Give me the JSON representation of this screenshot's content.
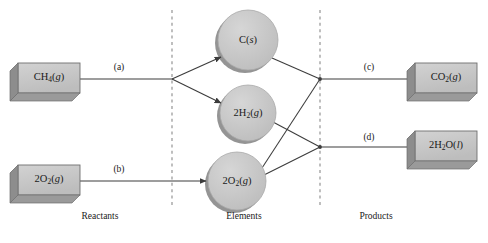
{
  "diagram": {
    "background_color": "#ffffff",
    "shape_fill_color": "#c8c8c8",
    "shape_shadow_color": "#8f8f8f",
    "shape_border_color": "#6b6b6b",
    "line_color": "#3c3c3c",
    "divider_color": "#8a8a8a",
    "text_color": "#1a1a1a"
  },
  "columns": [
    {
      "id": "reactants",
      "label": "Reactants",
      "x": 100,
      "y": 216
    },
    {
      "id": "elements",
      "label": "Elements",
      "x": 244,
      "y": 216
    },
    {
      "id": "products",
      "label": "Products",
      "x": 376,
      "y": 216
    }
  ],
  "dividers": [
    {
      "id": "divider-left",
      "x": 172,
      "y1": 10,
      "y2": 206
    },
    {
      "id": "divider-right",
      "x": 320,
      "y1": 10,
      "y2": 206
    }
  ],
  "boxes": [
    {
      "id": "box-ch4",
      "name": "reactant-methane",
      "formula_html": "CH<sub>4</sub>(<i>g</i>)",
      "formula_text": "CH4(g)",
      "x": 18,
      "y": 63,
      "w": 62,
      "h": 30
    },
    {
      "id": "box-o2",
      "name": "reactant-oxygen",
      "formula_html": "2O<sub>2</sub>(<i>g</i>)",
      "formula_text": "2O2(g)",
      "x": 18,
      "y": 165,
      "w": 62,
      "h": 30
    },
    {
      "id": "box-co2",
      "name": "product-carbon-dioxide",
      "formula_html": "CO<sub>2</sub>(<i>g</i>)",
      "formula_text": "CO2(g)",
      "x": 415,
      "y": 63,
      "w": 62,
      "h": 30
    },
    {
      "id": "box-h2o",
      "name": "product-water",
      "formula_html": "2H<sub>2</sub>O(<i>l</i>)",
      "formula_text": "2H2O(l)",
      "x": 415,
      "y": 131,
      "w": 62,
      "h": 30
    }
  ],
  "circles": [
    {
      "id": "circle-carbon",
      "name": "element-carbon",
      "formula_html": "C(<i>s</i>)",
      "formula_text": "C(s)",
      "cx": 248,
      "cy": 40,
      "r": 30
    },
    {
      "id": "circle-hydrogen",
      "name": "element-hydrogen",
      "formula_html": "2H<sub>2</sub>(<i>g</i>)",
      "formula_text": "2H2(g)",
      "cx": 248,
      "cy": 113,
      "r": 28
    },
    {
      "id": "circle-oxygen",
      "name": "element-oxygen",
      "formula_html": "2O<sub>2</sub>(<i>g</i>)",
      "formula_text": "2O2(g)",
      "cx": 237,
      "cy": 181,
      "r": 29
    }
  ],
  "edge_labels": [
    {
      "id": "label-a",
      "text": "(a)",
      "x": 119,
      "y": 62
    },
    {
      "id": "label-b",
      "text": "(b)",
      "x": 119,
      "y": 164
    },
    {
      "id": "label-c",
      "text": "(c)",
      "x": 369,
      "y": 62
    },
    {
      "id": "label-d",
      "text": "(d)",
      "x": 369,
      "y": 132
    }
  ],
  "arrows": [
    {
      "id": "arrow-a-stem",
      "from": "box-ch4",
      "to": "split-node-left",
      "arrowhead": false
    },
    {
      "id": "arrow-a-carbon",
      "from": "split-node-left",
      "to": "circle-carbon",
      "arrowhead": true
    },
    {
      "id": "arrow-a-hydrogen",
      "from": "split-node-left",
      "to": "circle-hydrogen",
      "arrowhead": true
    },
    {
      "id": "arrow-b",
      "from": "box-o2",
      "to": "circle-oxygen",
      "arrowhead": true
    },
    {
      "id": "link-carbon-top",
      "from": "circle-carbon",
      "to": "join-node-top",
      "arrowhead": false
    },
    {
      "id": "link-oxygen-top",
      "from": "circle-oxygen",
      "to": "join-node-top",
      "arrowhead": false
    },
    {
      "id": "link-hydrogen-bottom",
      "from": "circle-hydrogen",
      "to": "join-node-bottom",
      "arrowhead": false
    },
    {
      "id": "link-oxygen-bottom",
      "from": "circle-oxygen",
      "to": "join-node-bottom",
      "arrowhead": false
    },
    {
      "id": "arrow-c",
      "from": "join-node-top",
      "to": "box-co2",
      "arrowhead": true
    },
    {
      "id": "arrow-d",
      "from": "join-node-bottom",
      "to": "box-h2o",
      "arrowhead": true
    }
  ]
}
